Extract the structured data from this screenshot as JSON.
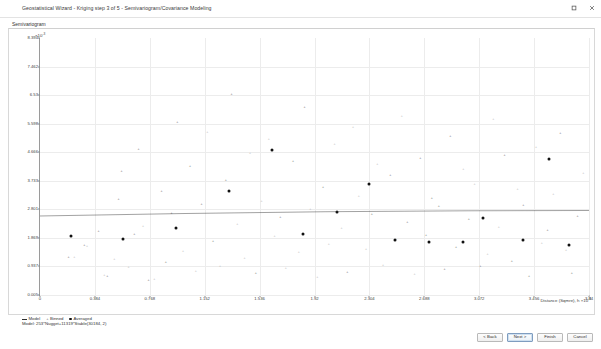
{
  "window": {
    "title": "Geostatistical Wizard - Kriging step 3 of 5 - Semivariogram/Covariance Modeling",
    "controls": [
      {
        "name": "restore-window-button",
        "glyph": "restore-icon"
      },
      {
        "name": "close-window-button",
        "glyph": "close-icon"
      }
    ]
  },
  "panel": {
    "label": "Semivariogram"
  },
  "footer": {
    "buttons": [
      {
        "label": "< Back",
        "name": "back-button",
        "style": "normal"
      },
      {
        "label": "Next >",
        "name": "next-button",
        "style": "primary"
      },
      {
        "label": "Finish",
        "name": "finish-button",
        "style": "normal"
      },
      {
        "label": "Cancel",
        "name": "cancel-button",
        "style": "normal"
      }
    ]
  },
  "legend": [
    {
      "marker": "line",
      "label": "Model"
    },
    {
      "marker": "cross",
      "label": "Binned"
    },
    {
      "marker": "dot",
      "label": "Averaged"
    }
  ],
  "note": {
    "text": "Model:  253*Nugget+11319*Stable(30184, 2)"
  },
  "chart_data": {
    "type": "scatter",
    "title": "Semivariogram",
    "xlabel": "Distance (Sqmre), h",
    "ylabel": "",
    "y_exponent_label": "×10",
    "y_exponent_value": "-3",
    "x_exponent_label": "×10",
    "x_exponent_value": "-3",
    "xlim": [
      0,
      3.84
    ],
    "ylim": [
      0,
      8.394
    ],
    "grid": true,
    "legend_position": "below-axis-left",
    "yticks": [
      {
        "value": 8.394,
        "label": "8.394"
      },
      {
        "value": 7.462,
        "label": "7.462"
      },
      {
        "value": 6.53,
        "label": "6.53"
      },
      {
        "value": 5.598,
        "label": "5.598"
      },
      {
        "value": 4.666,
        "label": "4.666"
      },
      {
        "value": 3.733,
        "label": "3.733"
      },
      {
        "value": 2.801,
        "label": "2.801"
      },
      {
        "value": 1.869,
        "label": "1.869"
      },
      {
        "value": 0.937,
        "label": "0.937"
      },
      {
        "value": 0.005,
        "label": "0.005"
      }
    ],
    "xticks": [
      {
        "value": 0,
        "label": "0"
      },
      {
        "value": 0.384,
        "label": "0.384"
      },
      {
        "value": 0.768,
        "label": "0.768"
      },
      {
        "value": 1.152,
        "label": "1.152"
      },
      {
        "value": 1.536,
        "label": "1.536"
      },
      {
        "value": 1.92,
        "label": "1.92"
      },
      {
        "value": 2.304,
        "label": "2.304"
      },
      {
        "value": 2.688,
        "label": "2.688"
      },
      {
        "value": 3.072,
        "label": "3.072"
      },
      {
        "value": 3.456,
        "label": "3.456"
      },
      {
        "value": 3.84,
        "label": "3.84"
      }
    ],
    "model_line": {
      "name": "Model",
      "color": "#2f2f2f",
      "points": [
        [
          0,
          2.58
        ],
        [
          1.0,
          2.66
        ],
        [
          2.0,
          2.72
        ],
        [
          3.0,
          2.75
        ],
        [
          3.84,
          2.76
        ]
      ]
    },
    "series": [
      {
        "name": "Binned",
        "marker": "cross",
        "color": "#6f6f6f",
        "points": [
          [
            0.2,
            1.22
          ],
          [
            0.24,
            1.21
          ],
          [
            0.31,
            1.6
          ],
          [
            0.33,
            1.58
          ],
          [
            0.41,
            2.05
          ],
          [
            0.45,
            0.62
          ],
          [
            0.47,
            0.58
          ],
          [
            0.52,
            1.14
          ],
          [
            0.55,
            3.1
          ],
          [
            0.57,
            4.02
          ],
          [
            0.62,
            0.88
          ],
          [
            0.66,
            1.96
          ],
          [
            0.69,
            4.72
          ],
          [
            0.72,
            2.22
          ],
          [
            0.76,
            0.46
          ],
          [
            0.8,
            0.5
          ],
          [
            0.85,
            3.35
          ],
          [
            0.88,
            1.05
          ],
          [
            0.92,
            2.66
          ],
          [
            0.96,
            5.62
          ],
          [
            1.0,
            1.42
          ],
          [
            1.05,
            4.18
          ],
          [
            1.09,
            0.74
          ],
          [
            1.13,
            2.95
          ],
          [
            1.17,
            5.3
          ],
          [
            1.21,
            1.73
          ],
          [
            1.26,
            0.93
          ],
          [
            1.3,
            3.72
          ],
          [
            1.34,
            6.52
          ],
          [
            1.38,
            2.3
          ],
          [
            1.43,
            1.16
          ],
          [
            1.47,
            4.6
          ],
          [
            1.51,
            0.68
          ],
          [
            1.55,
            3.05
          ],
          [
            1.6,
            5.05
          ],
          [
            1.64,
            1.88
          ],
          [
            1.68,
            2.5
          ],
          [
            1.72,
            0.84
          ],
          [
            1.77,
            4.35
          ],
          [
            1.81,
            1.36
          ],
          [
            1.85,
            6.1
          ],
          [
            1.89,
            2.78
          ],
          [
            1.94,
            0.55
          ],
          [
            1.98,
            3.48
          ],
          [
            2.02,
            1.62
          ],
          [
            2.06,
            4.9
          ],
          [
            2.11,
            2.14
          ],
          [
            2.15,
            0.72
          ],
          [
            2.19,
            5.45
          ],
          [
            2.23,
            3.2
          ],
          [
            2.28,
            1.48
          ],
          [
            2.32,
            2.62
          ],
          [
            2.36,
            4.25
          ],
          [
            2.4,
            0.96
          ],
          [
            2.45,
            3.88
          ],
          [
            2.49,
            1.78
          ],
          [
            2.53,
            5.8
          ],
          [
            2.57,
            2.36
          ],
          [
            2.62,
            0.64
          ],
          [
            2.66,
            4.45
          ],
          [
            2.7,
            1.92
          ],
          [
            2.74,
            3.12
          ],
          [
            2.79,
            2.88
          ],
          [
            2.83,
            0.8
          ],
          [
            2.87,
            5.15
          ],
          [
            2.91,
            1.54
          ],
          [
            2.96,
            4.08
          ],
          [
            3.0,
            2.45
          ],
          [
            3.04,
            3.6
          ],
          [
            3.08,
            0.92
          ],
          [
            3.13,
            1.3
          ],
          [
            3.17,
            5.7
          ],
          [
            3.21,
            2.2
          ],
          [
            3.25,
            4.55
          ],
          [
            3.3,
            1.08
          ],
          [
            3.34,
            3.42
          ],
          [
            3.38,
            2.92
          ],
          [
            3.42,
            0.58
          ],
          [
            3.47,
            4.8
          ],
          [
            3.51,
            1.66
          ],
          [
            3.55,
            2.08
          ],
          [
            3.59,
            3.28
          ],
          [
            3.64,
            5.25
          ],
          [
            3.68,
            1.44
          ],
          [
            3.72,
            0.7
          ],
          [
            3.76,
            2.55
          ],
          [
            3.8,
            3.95
          ]
        ]
      },
      {
        "name": "Averaged",
        "marker": "dot",
        "color": "#111111",
        "points": [
          [
            0.22,
            1.92
          ],
          [
            0.58,
            1.82
          ],
          [
            0.95,
            2.18
          ],
          [
            1.32,
            3.4
          ],
          [
            1.62,
            4.72
          ],
          [
            1.84,
            2.0
          ],
          [
            2.08,
            2.7
          ],
          [
            2.3,
            3.62
          ],
          [
            2.48,
            1.8
          ],
          [
            2.72,
            1.72
          ],
          [
            2.96,
            1.74
          ],
          [
            3.1,
            2.52
          ],
          [
            3.38,
            1.8
          ],
          [
            3.56,
            4.45
          ],
          [
            3.7,
            1.62
          ]
        ]
      }
    ]
  }
}
